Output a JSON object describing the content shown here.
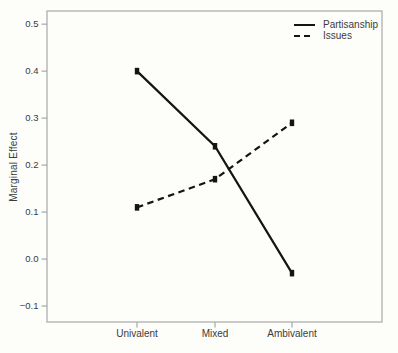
{
  "figure": {
    "background": "#fdfdfa",
    "frame_color": "#a8a8a8",
    "line_color": "#141414",
    "text_color": "#3b3b3b"
  },
  "chart_data": {
    "type": "line",
    "title": "",
    "xlabel": "",
    "ylabel": "Marginal Effect",
    "categories": [
      "Univalent",
      "Mixed",
      "Ambivalent"
    ],
    "series": [
      {
        "name": "Partisanship",
        "line_style": "solid",
        "marker": "square",
        "values": [
          0.4,
          0.24,
          -0.03
        ]
      },
      {
        "name": "Issues",
        "line_style": "dashed",
        "marker": "square",
        "values": [
          0.11,
          0.17,
          0.29
        ]
      }
    ],
    "y_ticks": [
      0.5,
      0.4,
      0.3,
      0.2,
      0.1,
      0.0,
      -0.1
    ],
    "ylim": [
      -0.134,
      0.528
    ],
    "grid": false,
    "legend_position": "top-right-inside"
  }
}
